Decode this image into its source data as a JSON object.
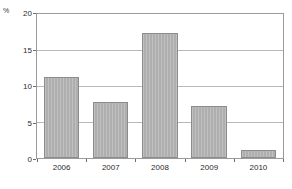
{
  "chart_data": {
    "type": "bar",
    "title": "",
    "subtitle": "",
    "xlabel": "",
    "ylabel": "",
    "unit_label": "%",
    "categories": [
      "2006",
      "2007",
      "2008",
      "2009",
      "2010"
    ],
    "values": [
      11.2,
      7.8,
      17.3,
      7.2,
      1.1
    ],
    "ylim": [
      0,
      20
    ],
    "yticks": [
      0,
      5,
      10,
      15,
      20
    ],
    "ytick_labels": [
      "0",
      "5",
      "10",
      "15",
      "20"
    ],
    "gridlines": [
      5,
      10,
      15
    ],
    "grid": true,
    "legend": false,
    "legend_position": "none",
    "series": [
      {
        "name": "",
        "values": [
          11.2,
          7.8,
          17.3,
          7.2,
          1.1
        ]
      }
    ],
    "colors": {
      "bar_fill": "#b4b4b4",
      "bar_border": "#8c8c8c",
      "gridline": "#b9b9b9",
      "frame": "#9a9a9a",
      "text": "#2b2b2b",
      "background": "#ffffff"
    }
  }
}
